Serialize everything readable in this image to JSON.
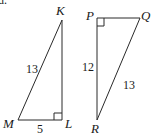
{
  "part_label": "d.",
  "triangles": [
    {
      "name": "KLM",
      "vertices": {
        "K": {
          "label": "K",
          "x": 62,
          "y": 20
        },
        "L": {
          "label": "L",
          "x": 62,
          "y": 120
        },
        "M": {
          "label": "M",
          "x": 18,
          "y": 120
        }
      },
      "right_angle_at": "L",
      "sides": {
        "hypotenuse_MK": "13",
        "leg_ML": "5"
      }
    },
    {
      "name": "PQR",
      "vertices": {
        "P": {
          "label": "P",
          "x": 97,
          "y": 18
        },
        "Q": {
          "label": "Q",
          "x": 140,
          "y": 18
        },
        "R": {
          "label": "R",
          "x": 97,
          "y": 120
        }
      },
      "right_angle_at": "P",
      "sides": {
        "leg_PR": "12",
        "hypotenuse_QR": "13"
      }
    }
  ]
}
